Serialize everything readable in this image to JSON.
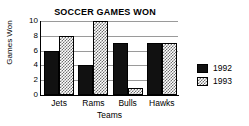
{
  "chart_data": {
    "type": "bar",
    "title": "SOCCER GAMES WON",
    "xlabel": "Teams",
    "ylabel": "Games Won",
    "categories": [
      "Jets",
      "Rams",
      "Bulls",
      "Hawks"
    ],
    "series": [
      {
        "name": "1992",
        "values": [
          6,
          4,
          7,
          7
        ],
        "color": "#111111"
      },
      {
        "name": "1993",
        "values": [
          8,
          10,
          1,
          7
        ],
        "color": "#6f6f6f"
      }
    ],
    "ylim": [
      0,
      10
    ],
    "yticks": [
      0,
      2,
      4,
      6,
      8,
      10
    ],
    "ytick_labels": [
      "0",
      "2",
      "4",
      "6",
      "8",
      "10"
    ],
    "grid": true,
    "legend_position": "right"
  },
  "legend": {
    "entries": [
      {
        "label": "1992"
      },
      {
        "label": "1993"
      }
    ]
  }
}
